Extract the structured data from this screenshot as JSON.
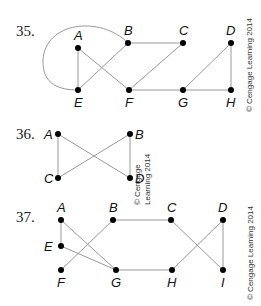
{
  "graphs": [
    {
      "number": "35.",
      "copyright": "© Cengage Learning 2014",
      "vertices": [
        {
          "id": "A",
          "x": 78,
          "y": 48,
          "lx": 74,
          "ly": 40
        },
        {
          "id": "B",
          "x": 128,
          "y": 43,
          "lx": 124,
          "ly": 35
        },
        {
          "id": "C",
          "x": 183,
          "y": 43,
          "lx": 179,
          "ly": 35
        },
        {
          "id": "D",
          "x": 231,
          "y": 43,
          "lx": 226,
          "ly": 35
        },
        {
          "id": "E",
          "x": 78,
          "y": 90,
          "lx": 74,
          "ly": 107
        },
        {
          "id": "F",
          "x": 129,
          "y": 90,
          "lx": 125,
          "ly": 107
        },
        {
          "id": "G",
          "x": 183,
          "y": 90,
          "lx": 178,
          "ly": 107
        },
        {
          "id": "H",
          "x": 231,
          "y": 90,
          "lx": 226,
          "ly": 107
        }
      ],
      "edges": [
        [
          "A",
          "E"
        ],
        [
          "A",
          "F"
        ],
        [
          "B",
          "E"
        ],
        [
          "B",
          "C"
        ],
        [
          "C",
          "F"
        ],
        [
          "F",
          "G"
        ],
        [
          "G",
          "H"
        ],
        [
          "G",
          "D"
        ],
        [
          "D",
          "H"
        ]
      ],
      "loop": {
        "from": "B",
        "to": "E",
        "path": "M128,43 C100,15 45,22 43,60 C42,85 60,90 78,90"
      }
    },
    {
      "number": "36.",
      "copyright": "© Cengage Learning 2014",
      "vertices": [
        {
          "id": "A",
          "x": 58,
          "y": 134,
          "lx": 44,
          "ly": 139
        },
        {
          "id": "B",
          "x": 130,
          "y": 134,
          "lx": 135,
          "ly": 139
        },
        {
          "id": "C",
          "x": 58,
          "y": 178,
          "lx": 44,
          "ly": 183
        },
        {
          "id": "D",
          "x": 130,
          "y": 178,
          "lx": 135,
          "ly": 183
        }
      ],
      "edges": [
        [
          "A",
          "C"
        ],
        [
          "A",
          "D"
        ],
        [
          "B",
          "C"
        ],
        [
          "B",
          "D"
        ]
      ]
    },
    {
      "number": "37.",
      "copyright": "© Cengage Learning 2014",
      "vertices": [
        {
          "id": "A",
          "x": 61,
          "y": 220,
          "lx": 57,
          "ly": 212
        },
        {
          "id": "B",
          "x": 113,
          "y": 220,
          "lx": 109,
          "ly": 212
        },
        {
          "id": "C",
          "x": 171,
          "y": 220,
          "lx": 167,
          "ly": 212
        },
        {
          "id": "D",
          "x": 223,
          "y": 220,
          "lx": 218,
          "ly": 212
        },
        {
          "id": "E",
          "x": 61,
          "y": 246,
          "lx": 44,
          "ly": 251
        },
        {
          "id": "F",
          "x": 61,
          "y": 270,
          "lx": 57,
          "ly": 287
        },
        {
          "id": "G",
          "x": 116,
          "y": 270,
          "lx": 111,
          "ly": 287
        },
        {
          "id": "H",
          "x": 172,
          "y": 270,
          "lx": 167,
          "ly": 287
        },
        {
          "id": "I",
          "x": 223,
          "y": 270,
          "lx": 221,
          "ly": 287
        }
      ],
      "edges": [
        [
          "A",
          "E"
        ],
        [
          "A",
          "G"
        ],
        [
          "E",
          "G"
        ],
        [
          "B",
          "F"
        ],
        [
          "B",
          "C"
        ],
        [
          "G",
          "H"
        ],
        [
          "C",
          "I"
        ],
        [
          "H",
          "D"
        ],
        [
          "D",
          "I"
        ]
      ]
    }
  ]
}
